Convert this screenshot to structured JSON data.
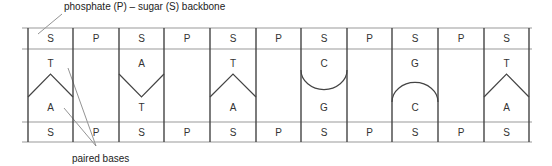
{
  "title_label": "phosphate (P) – sugar (S) backbone",
  "bottom_label": "paired bases",
  "top_strand": [
    "S",
    "P",
    "S",
    "P",
    "S",
    "P",
    "S",
    "P",
    "S",
    "P",
    "S"
  ],
  "bottom_strand": [
    "S",
    "P",
    "S",
    "P",
    "S",
    "P",
    "S",
    "P",
    "S",
    "P",
    "S"
  ],
  "base_pairs": [
    {
      "top": "T",
      "bottom": "A",
      "shape": "chevron-up"
    },
    {
      "top": "A",
      "bottom": "T",
      "shape": "chevron-down"
    },
    {
      "top": "T",
      "bottom": "A",
      "shape": "chevron-up"
    },
    {
      "top": "C",
      "bottom": "G",
      "shape": "arc-down"
    },
    {
      "top": "G",
      "bottom": "C",
      "shape": "arc-up"
    },
    {
      "top": "T",
      "bottom": "A",
      "shape": "chevron-up"
    }
  ]
}
